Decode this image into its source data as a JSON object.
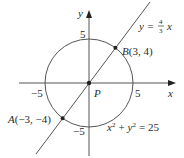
{
  "diagram": {
    "axes": {
      "x_label": "x",
      "y_label": "y",
      "origin_label": "P"
    },
    "ticks": {
      "x_pos": "5",
      "x_neg": "−5",
      "y_pos": "5",
      "y_neg": "−5"
    },
    "line": {
      "label_lhs": "y =",
      "frac_num": "4",
      "frac_den": "3",
      "label_var": "x",
      "slope": 1.3333
    },
    "circle": {
      "equation_x": "x",
      "equation_plus": "+",
      "equation_y": "y",
      "equation_rhs": "= 25",
      "exp": "2",
      "radius": 5
    },
    "points": [
      {
        "name": "B",
        "label": "B(3, 4)",
        "x": 3,
        "y": 4
      },
      {
        "name": "A",
        "label": "A(−3, −4)",
        "x": -3,
        "y": -4
      }
    ],
    "colors": {
      "stroke": "#555555",
      "point": "#222222"
    }
  }
}
